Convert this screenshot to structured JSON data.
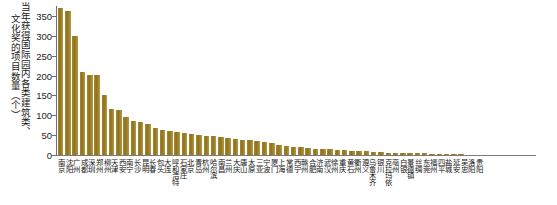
{
  "chart_data": {
    "type": "bar",
    "title": "",
    "xlabel": "",
    "ylabel": "当年获得国际园内各类建筑类、文化奖的项目数量（个）",
    "ylim": [
      0,
      375
    ],
    "yticks": [
      0,
      50,
      100,
      150,
      200,
      250,
      300,
      350
    ],
    "ytick_labels": [
      "0",
      "50",
      "100",
      "150",
      "200",
      "250",
      "300",
      "350"
    ],
    "grid": false,
    "legend": "none",
    "bar_color": "#9c8028",
    "categories": [
      "南京",
      "沈阳",
      "广州",
      "成都",
      "深圳",
      "郑州",
      "柳州",
      "天津",
      "西安",
      "南宁",
      "长沙",
      "昆明",
      "长春",
      "包头",
      "大连",
      "呼和浩特",
      "石家庄",
      "北京",
      "青岛",
      "杭州",
      "哈尔滨",
      "南昌",
      "兰州",
      "大庆",
      "唐山",
      "太原",
      "三亚",
      "宁波",
      "厦门",
      "上海",
      "常德",
      "西宁",
      "赣州",
      "合肥",
      "济南",
      "武汉",
      "徐州",
      "重庆",
      "黄石",
      "衢州",
      "遵义",
      "乌鲁木齐",
      "银川",
      "克拉玛依",
      "亳州",
      "白银",
      "景德镇",
      "丝绸",
      "东莞",
      "福州",
      "四平",
      "盐城",
      "延安",
      "吴忠",
      "洛阳",
      "贵阳"
    ],
    "values": [
      370,
      362,
      299,
      208,
      201,
      201,
      152,
      116,
      113,
      96,
      85,
      84,
      77,
      68,
      63,
      61,
      58,
      56,
      53,
      51,
      49,
      47,
      45,
      43,
      41,
      39,
      37,
      35,
      33,
      31,
      24,
      22,
      20,
      19,
      18,
      16,
      15,
      14,
      13,
      12,
      11,
      10,
      9,
      8,
      7,
      6,
      6,
      5,
      5,
      4,
      4,
      3,
      3,
      2,
      2,
      1
    ]
  },
  "ylabel_parts": {
    "line1": "当年获得国际园内各类建筑类、",
    "line2": "文化奖的项目数量（个）"
  }
}
